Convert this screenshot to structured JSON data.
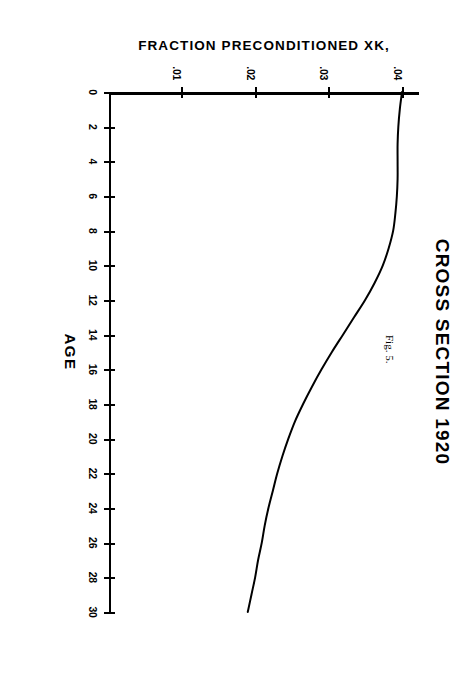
{
  "document": {
    "figure_caption": "Fig. 5."
  },
  "chart_data": {
    "type": "line",
    "title": "CROSS SECTION 1920",
    "xlabel": "AGE",
    "ylabel": "FRACTION PRECONDITIONED XK,",
    "orientation_note": "printed sideways; plot rotated 90 degrees on the page",
    "xlim": [
      0,
      30
    ],
    "ylim": [
      0,
      0.042
    ],
    "xticks": [
      0,
      2,
      4,
      6,
      8,
      10,
      12,
      14,
      16,
      18,
      20,
      22,
      24,
      26,
      28,
      30
    ],
    "xticklabels": [
      "0",
      "2",
      "4",
      "6",
      "8",
      "10",
      "12",
      "14",
      "16",
      "18",
      "20",
      "22",
      "24",
      "26",
      "28",
      "30"
    ],
    "yticks": [
      0.01,
      0.02,
      0.03,
      0.04
    ],
    "yticklabels": [
      ".01",
      ".02",
      ".03",
      ".04"
    ],
    "grid": false,
    "legend": false,
    "line_color": "#000000",
    "series": [
      {
        "name": "XK",
        "x": [
          0,
          1,
          2,
          3,
          4,
          5,
          6,
          7,
          8,
          9,
          10,
          11,
          12,
          13,
          14,
          15,
          16,
          17,
          18,
          19,
          20,
          21,
          22,
          23,
          24,
          25,
          26,
          27,
          28,
          29,
          30
        ],
        "values": [
          0.0397,
          0.0394,
          0.0392,
          0.0391,
          0.0391,
          0.0391,
          0.039,
          0.0388,
          0.0385,
          0.0379,
          0.0371,
          0.036,
          0.0347,
          0.0332,
          0.0317,
          0.0302,
          0.0288,
          0.0275,
          0.0263,
          0.0252,
          0.0243,
          0.0235,
          0.0228,
          0.0222,
          0.0216,
          0.0211,
          0.0207,
          0.0202,
          0.0198,
          0.0193,
          0.0188
        ]
      }
    ]
  }
}
